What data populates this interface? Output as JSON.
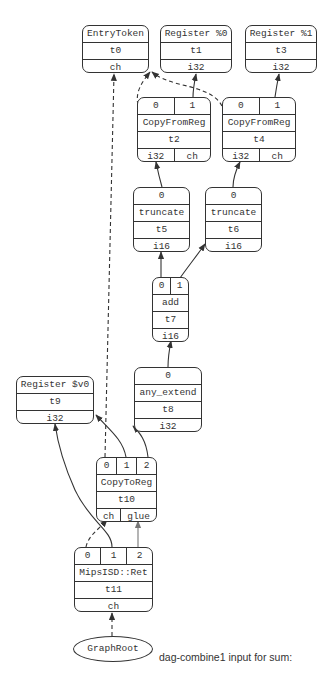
{
  "caption": "dag-combine1 input for sum:",
  "nodes": {
    "t0": {
      "title": "EntryToken",
      "id": "t0",
      "types": [
        "ch"
      ]
    },
    "t1": {
      "title": "Register %0",
      "id": "t1",
      "types": [
        "i32"
      ]
    },
    "t3": {
      "title": "Register %1",
      "id": "t3",
      "types": [
        "i32"
      ]
    },
    "t2": {
      "ports": [
        "0",
        "1"
      ],
      "title": "CopyFromReg",
      "id": "t2",
      "types": [
        "i32",
        "ch"
      ]
    },
    "t4": {
      "ports": [
        "0",
        "1"
      ],
      "title": "CopyFromReg",
      "id": "t4",
      "types": [
        "i32",
        "ch"
      ]
    },
    "t5": {
      "ports": [
        "0"
      ],
      "title": "truncate",
      "id": "t5",
      "types": [
        "i16"
      ]
    },
    "t6": {
      "ports": [
        "0"
      ],
      "title": "truncate",
      "id": "t6",
      "types": [
        "i16"
      ]
    },
    "t7": {
      "ports": [
        "0",
        "1"
      ],
      "title": "add",
      "id": "t7",
      "types": [
        "i16"
      ]
    },
    "t8": {
      "ports": [
        "0"
      ],
      "title": "any_extend",
      "id": "t8",
      "types": [
        "i32"
      ]
    },
    "t9": {
      "title": "Register $v0",
      "id": "t9",
      "types": [
        "i32"
      ]
    },
    "t10": {
      "ports": [
        "0",
        "1",
        "2"
      ],
      "title": "CopyToReg",
      "id": "t10",
      "types": [
        "ch",
        "glue"
      ]
    },
    "t11": {
      "ports": [
        "0",
        "1",
        "2"
      ],
      "title": "MipsISD::Ret",
      "id": "t11",
      "types": [
        "ch"
      ]
    },
    "root": {
      "title": "GraphRoot"
    }
  },
  "edges": [
    {
      "from": "t2.0",
      "to": "t0",
      "style": "dashed"
    },
    {
      "from": "t2.1",
      "to": "t1",
      "style": "solid"
    },
    {
      "from": "t4.0",
      "to": "t0",
      "style": "dashed"
    },
    {
      "from": "t4.1",
      "to": "t3",
      "style": "solid"
    },
    {
      "from": "t5.0",
      "to": "t2",
      "style": "solid"
    },
    {
      "from": "t6.0",
      "to": "t4",
      "style": "solid"
    },
    {
      "from": "t7.0",
      "to": "t5",
      "style": "solid"
    },
    {
      "from": "t7.1",
      "to": "t6",
      "style": "solid"
    },
    {
      "from": "t8.0",
      "to": "t7",
      "style": "solid"
    },
    {
      "from": "t10.0",
      "to": "t0",
      "style": "dashed"
    },
    {
      "from": "t10.1",
      "to": "t9",
      "style": "solid"
    },
    {
      "from": "t10.2",
      "to": "t8",
      "style": "solid"
    },
    {
      "from": "t11.0",
      "to": "t10.ch",
      "style": "dashed"
    },
    {
      "from": "t11.1",
      "to": "t9",
      "style": "solid"
    },
    {
      "from": "t11.2",
      "to": "t10.glue",
      "style": "solid-gray"
    },
    {
      "from": "root",
      "to": "t11",
      "style": "dashed"
    }
  ]
}
